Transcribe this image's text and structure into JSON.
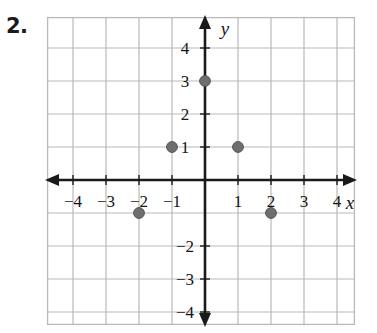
{
  "problem": {
    "number": "2."
  },
  "colors": {
    "grid_line": "#b9b9b9",
    "axis": "#1a1a1a",
    "point_fill": "#6e6e6e",
    "point_stroke": "#545454",
    "text": "#141414",
    "background": "#ffffff"
  },
  "chart_data": {
    "type": "scatter",
    "title": "",
    "xlabel": "x",
    "ylabel": "y",
    "xlim": [
      -4.7,
      4.7
    ],
    "ylim": [
      -4.7,
      4.7
    ],
    "grid": true,
    "legend": "none",
    "x_ticks": [
      -4,
      -3,
      -2,
      -1,
      1,
      2,
      3,
      4
    ],
    "x_tick_labels": [
      "−4",
      "−3",
      "−2",
      "−1",
      "1",
      "2",
      "3",
      "4"
    ],
    "y_ticks": [
      4,
      3,
      2,
      1,
      -2,
      -3,
      -4
    ],
    "y_tick_labels": [
      "4",
      "3",
      "2",
      "1",
      "−2",
      "−3",
      "−4"
    ],
    "points": [
      {
        "x": -1,
        "y": 1,
        "label": "(-1, 1)"
      },
      {
        "x": 0,
        "y": 3,
        "label": "(0, 3)"
      },
      {
        "x": 1,
        "y": 1,
        "label": "(1, 1)"
      },
      {
        "x": -2,
        "y": -1,
        "label": "(-2, -1)"
      },
      {
        "x": 2,
        "y": -1,
        "label": "(2, -1)"
      }
    ]
  }
}
